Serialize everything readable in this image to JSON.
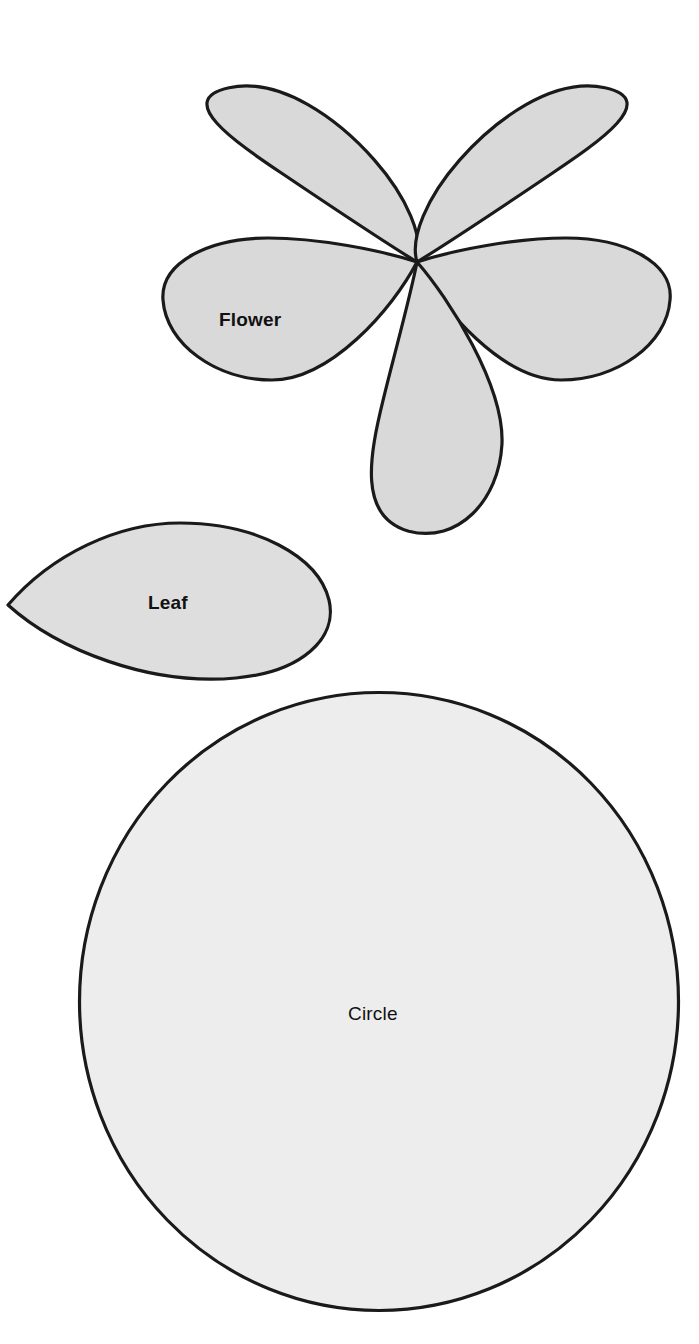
{
  "page": {
    "background_color": "#ffffff",
    "width": 699,
    "height": 1344
  },
  "style": {
    "outline_color": "#1a1a1a",
    "flower_fill": "#d9d9d9",
    "leaf_fill": "#dedede",
    "circle_fill": "#ededed",
    "label_color": "#111111"
  },
  "shapes": [
    {
      "id": "flower",
      "name": "Flower",
      "label": "Flower",
      "fill": "#d9d9d9",
      "stroke": "#1a1a1a",
      "petal_count": 5,
      "bounds": {
        "x": 163,
        "y": 30,
        "width": 507,
        "height": 504
      },
      "center": {
        "x": 417,
        "y": 262
      },
      "label_position": {
        "x": 264,
        "y": 322
      }
    },
    {
      "id": "leaf",
      "name": "Leaf",
      "label": "Leaf",
      "fill": "#dedede",
      "stroke": "#1a1a1a",
      "bounds": {
        "x": 8,
        "y": 523,
        "width": 322,
        "height": 157
      },
      "tip": {
        "x": 8,
        "y": 605
      },
      "label_position": {
        "x": 176,
        "y": 605
      }
    },
    {
      "id": "circle",
      "name": "Circle",
      "label": "Circle",
      "fill": "#ededed",
      "stroke": "#1a1a1a",
      "bounds": {
        "x": 78,
        "y": 691,
        "width": 602,
        "height": 621
      },
      "center": {
        "x": 379,
        "y": 1001
      },
      "radius_x": 301,
      "radius_y": 310,
      "label_position": {
        "x": 383,
        "y": 1016
      }
    }
  ]
}
